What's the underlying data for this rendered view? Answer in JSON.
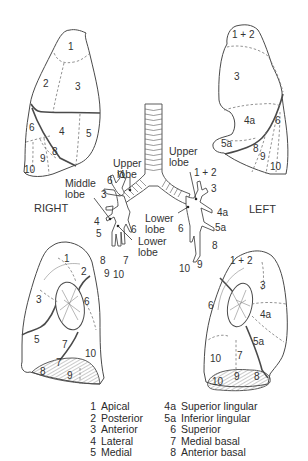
{
  "figure": {
    "side_labels": {
      "right": "RIGHT",
      "left": "LEFT"
    },
    "views": {
      "right_lateral": {
        "segments": [
          {
            "id": "1",
            "label": "1"
          },
          {
            "id": "2",
            "label": "2"
          },
          {
            "id": "3",
            "label": "3"
          },
          {
            "id": "4",
            "label": "4"
          },
          {
            "id": "5",
            "label": "5"
          },
          {
            "id": "6",
            "label": "6"
          },
          {
            "id": "8",
            "label": "8"
          },
          {
            "id": "9",
            "label": "9"
          },
          {
            "id": "10",
            "label": "10"
          }
        ]
      },
      "left_lateral": {
        "segments": [
          {
            "id": "1+2",
            "label": "1 + 2"
          },
          {
            "id": "3",
            "label": "3"
          },
          {
            "id": "4a",
            "label": "4a"
          },
          {
            "id": "5a",
            "label": "5a"
          },
          {
            "id": "6",
            "label": "6"
          },
          {
            "id": "8",
            "label": "8"
          },
          {
            "id": "9",
            "label": "9"
          },
          {
            "id": "10",
            "label": "10"
          }
        ]
      },
      "right_medial": {
        "segments": [
          {
            "id": "1",
            "label": "1"
          },
          {
            "id": "2",
            "label": "2"
          },
          {
            "id": "3",
            "label": "3"
          },
          {
            "id": "5",
            "label": "5"
          },
          {
            "id": "6",
            "label": "6"
          },
          {
            "id": "7a",
            "label": "7"
          },
          {
            "id": "7b",
            "label": "7"
          },
          {
            "id": "8",
            "label": "8"
          },
          {
            "id": "9",
            "label": "9"
          },
          {
            "id": "10",
            "label": "10"
          }
        ]
      },
      "left_medial": {
        "segments": [
          {
            "id": "1+2",
            "label": "1 + 2"
          },
          {
            "id": "3",
            "label": "3"
          },
          {
            "id": "4a",
            "label": "4a"
          },
          {
            "id": "5a",
            "label": "5a"
          },
          {
            "id": "6",
            "label": "6"
          },
          {
            "id": "7",
            "label": "7"
          },
          {
            "id": "10a",
            "label": "10"
          },
          {
            "id": "10b",
            "label": "10"
          },
          {
            "id": "9",
            "label": "9"
          },
          {
            "id": "8",
            "label": "8"
          }
        ]
      }
    },
    "bronchial_tree": {
      "right": {
        "lobes": {
          "upper": "Upper\nlobe",
          "middle": "Middle\nlobe",
          "lower": "Lower\nlobe"
        },
        "upper_lines": [
          "Upper",
          "lobe"
        ],
        "middle_lines": [
          "Middle",
          "lobe"
        ],
        "lower_lines": [
          "Lower",
          "lobe"
        ],
        "branch_labels": [
          "1",
          "6",
          "3",
          "4",
          "5",
          "6",
          "8",
          "7",
          "9",
          "10"
        ]
      },
      "left": {
        "upper_lines": [
          "Upper",
          "lobe"
        ],
        "lower_lines": [
          "Lower",
          "lobe"
        ],
        "branch_labels": [
          "1 + 2",
          "3",
          "4a",
          "5a",
          "6",
          "8",
          "10",
          "9"
        ]
      }
    }
  },
  "legend": {
    "column1": [
      {
        "num": "1",
        "name": "Apical"
      },
      {
        "num": "2",
        "name": "Posterior"
      },
      {
        "num": "3",
        "name": "Anterior"
      },
      {
        "num": "4",
        "name": "Lateral"
      },
      {
        "num": "5",
        "name": "Medial"
      }
    ],
    "column2": [
      {
        "num": "4a",
        "name": "Superior lingular"
      },
      {
        "num": "5a",
        "name": "Inferior lingular"
      },
      {
        "num": "6",
        "name": "Superior"
      },
      {
        "num": "7",
        "name": "Medial basal"
      },
      {
        "num": "8",
        "name": "Anterior basal"
      }
    ]
  }
}
